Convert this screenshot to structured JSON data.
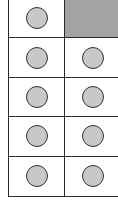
{
  "ten_frame": {
    "rows": 5,
    "columns": 2,
    "filled_count": 9,
    "empty_count": 1,
    "colors": {
      "counter_fill": "#c8c8c8",
      "counter_stroke": "#333333",
      "empty_cell_fill": "#a3a3a3",
      "grid_line": "#2a2a2a"
    },
    "cells": [
      {
        "row": 0,
        "col": 0,
        "filled": true
      },
      {
        "row": 0,
        "col": 1,
        "filled": false
      },
      {
        "row": 1,
        "col": 0,
        "filled": true
      },
      {
        "row": 1,
        "col": 1,
        "filled": true
      },
      {
        "row": 2,
        "col": 0,
        "filled": true
      },
      {
        "row": 2,
        "col": 1,
        "filled": true
      },
      {
        "row": 3,
        "col": 0,
        "filled": true
      },
      {
        "row": 3,
        "col": 1,
        "filled": true
      },
      {
        "row": 4,
        "col": 0,
        "filled": true
      },
      {
        "row": 4,
        "col": 1,
        "filled": true
      }
    ]
  }
}
